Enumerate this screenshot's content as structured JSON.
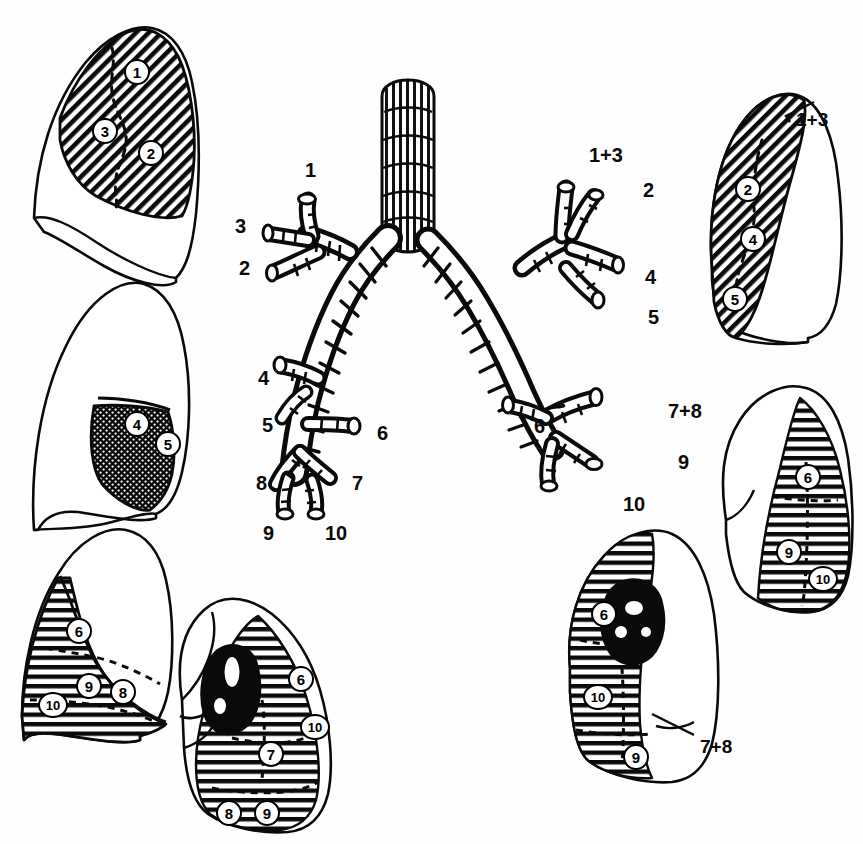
{
  "figure": {
    "background_color": "#fefefe",
    "ink_color": "#000000",
    "width": 863,
    "height": 844
  },
  "bronchial_tree": {
    "name": "central-bronchial-tree",
    "description": "Anterior view cast of trachea, main bronchi and segmental bronchi",
    "left_side_labels": [
      {
        "text": "1",
        "x": 305,
        "y": 160
      },
      {
        "text": "3",
        "x": 235,
        "y": 216
      },
      {
        "text": "2",
        "x": 239,
        "y": 258
      },
      {
        "text": "4",
        "x": 258,
        "y": 368
      },
      {
        "text": "5",
        "x": 262,
        "y": 415
      },
      {
        "text": "6",
        "x": 377,
        "y": 423
      },
      {
        "text": "8",
        "x": 256,
        "y": 473
      },
      {
        "text": "7",
        "x": 352,
        "y": 473
      },
      {
        "text": "9",
        "x": 263,
        "y": 523
      },
      {
        "text": "10",
        "x": 325,
        "y": 523
      }
    ],
    "right_side_labels": [
      {
        "text": "1+3",
        "x": 589,
        "y": 145
      },
      {
        "text": "2",
        "x": 643,
        "y": 180
      },
      {
        "text": "4",
        "x": 645,
        "y": 267
      },
      {
        "text": "5",
        "x": 648,
        "y": 307
      },
      {
        "text": "6",
        "x": 534,
        "y": 416
      },
      {
        "text": "7+8",
        "x": 668,
        "y": 401
      },
      {
        "text": "9",
        "x": 678,
        "y": 452
      },
      {
        "text": "10",
        "x": 623,
        "y": 494
      }
    ]
  },
  "lung_panels": [
    {
      "id": "left-lung-lateral-upper",
      "position": "top-left",
      "view": "left lung, lateral view, upper lobe",
      "shading": "diagonal-hatch",
      "callouts": [],
      "segments": [
        {
          "label": "1",
          "x": 124,
          "y": 59
        },
        {
          "label": "3",
          "x": 92,
          "y": 118
        },
        {
          "label": "2",
          "x": 138,
          "y": 140
        }
      ]
    },
    {
      "id": "left-lung-lateral-lingula",
      "position": "middle-left",
      "view": "left lung, lateral view, lingula",
      "shading": "dense-stipple",
      "callouts": [],
      "segments": [
        {
          "label": "4",
          "x": 124,
          "y": 411
        },
        {
          "label": "5",
          "x": 155,
          "y": 431
        }
      ]
    },
    {
      "id": "left-lung-lateral-lower",
      "position": "bottom-left",
      "view": "left lung, lateral view, lower lobe",
      "shading": "horizontal-hatch",
      "callouts": [],
      "segments": [
        {
          "label": "6",
          "x": 66,
          "y": 618
        },
        {
          "label": "9",
          "x": 76,
          "y": 673
        },
        {
          "label": "8",
          "x": 110,
          "y": 679
        },
        {
          "label": "10",
          "x": 38,
          "y": 692
        }
      ]
    },
    {
      "id": "left-lung-medial-lower",
      "position": "bottom-center",
      "view": "left lung, medial view, lower lobe",
      "shading": "horizontal-hatch",
      "has_hilum": true,
      "callouts": [],
      "segments": [
        {
          "label": "6",
          "x": 288,
          "y": 666
        },
        {
          "label": "10",
          "x": 300,
          "y": 714
        },
        {
          "label": "7",
          "x": 258,
          "y": 741
        },
        {
          "label": "8",
          "x": 216,
          "y": 800
        },
        {
          "label": "9",
          "x": 254,
          "y": 800
        }
      ]
    },
    {
      "id": "right-lung-lateral-upper",
      "position": "top-right",
      "view": "right lung, lateral view, upper lobe",
      "shading": "diagonal-hatch",
      "callouts": [
        {
          "text": "1+3",
          "x": 796,
          "y": 110,
          "leader": true
        }
      ],
      "segments": [
        {
          "label": "2",
          "x": 735,
          "y": 176
        },
        {
          "label": "4",
          "x": 740,
          "y": 226
        },
        {
          "label": "5",
          "x": 722,
          "y": 286
        }
      ]
    },
    {
      "id": "right-lung-lateral-lower",
      "position": "middle-right",
      "view": "right lung, lateral view, lower lobe",
      "shading": "horizontal-hatch",
      "callouts": [],
      "segments": [
        {
          "label": "6",
          "x": 795,
          "y": 464
        },
        {
          "label": "9",
          "x": 776,
          "y": 539
        },
        {
          "label": "10",
          "x": 808,
          "y": 566
        }
      ]
    },
    {
      "id": "right-lung-medial-lower",
      "position": "bottom-right",
      "view": "right lung, medial view, lower lobe",
      "shading": "horizontal-hatch",
      "has_hilum": true,
      "callouts": [
        {
          "text": "7+8",
          "x": 700,
          "y": 737,
          "leader": true
        }
      ],
      "segments": [
        {
          "label": "6",
          "x": 591,
          "y": 601
        },
        {
          "label": "10",
          "x": 583,
          "y": 684
        },
        {
          "label": "9",
          "x": 623,
          "y": 744
        }
      ]
    }
  ]
}
